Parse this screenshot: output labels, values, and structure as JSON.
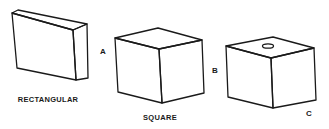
{
  "diagram": {
    "stroke_color": "#1a1a1a",
    "background": "#ffffff",
    "shapes": [
      {
        "id": "rectangular",
        "caption": "RECTANGULAR",
        "label": "A"
      },
      {
        "id": "square",
        "caption": "SQUARE",
        "label": "B"
      },
      {
        "id": "square-with-hole",
        "caption": "",
        "label": "C"
      }
    ]
  }
}
